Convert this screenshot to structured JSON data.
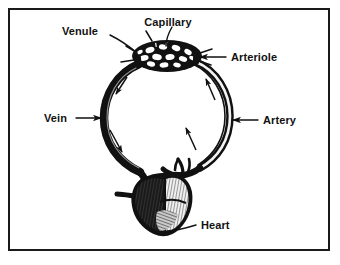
{
  "figure": {
    "background_color": "#ffffff",
    "ink_color": "#111111",
    "border_color": "#1a1a1a"
  },
  "labels": {
    "venule": "Venule",
    "capillary": "Capillary",
    "arteriole": "Arteriole",
    "vein": "Vein",
    "artery": "Artery",
    "heart": "Heart"
  },
  "parts": {
    "capillary_bed": "capillary-bed",
    "heart_organ": "heart-organ",
    "vein_vessel": "vein-vessel",
    "artery_vessel": "artery-vessel",
    "flow_arrows": "blood-flow-arrows"
  }
}
